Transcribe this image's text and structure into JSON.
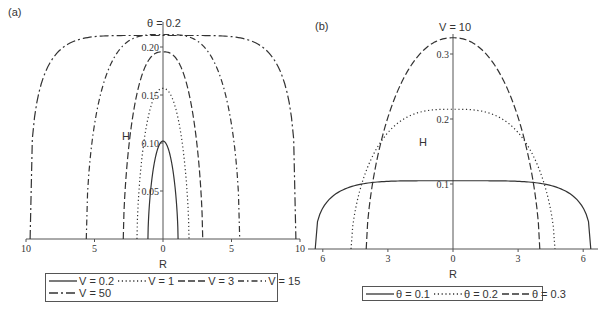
{
  "chart_data": [
    {
      "type": "line",
      "panel": "(a)",
      "title": "θ = 0.2",
      "xlabel": "R",
      "ylabel": "H",
      "x_ticks": [
        "10",
        "5",
        "0",
        "5",
        "10"
      ],
      "x_tick_values": [
        -10,
        -5,
        0,
        5,
        10
      ],
      "y_ticks": [
        "0.05",
        "0.10",
        "0.15",
        "0.20"
      ],
      "y_tick_values": [
        0.05,
        0.1,
        0.15,
        0.2
      ],
      "xlim": [
        -10,
        10
      ],
      "ylim": [
        0,
        0.225
      ],
      "grid": false,
      "legend_position": "bottom",
      "series": [
        {
          "name": "V = 0.2",
          "style": "solid",
          "half_width": 1.1,
          "peak": 0.102,
          "shape": 2.0
        },
        {
          "name": "V = 1",
          "style": "dotted",
          "half_width": 1.9,
          "peak": 0.157,
          "shape": 2.2
        },
        {
          "name": "V = 3",
          "style": "dashed",
          "half_width": 2.9,
          "peak": 0.195,
          "shape": 2.6
        },
        {
          "name": "V = 15",
          "style": "dashdot",
          "half_width": 5.6,
          "peak": 0.213,
          "shape": 3.5
        },
        {
          "name": "V = 50",
          "style": "longdash",
          "half_width": 9.7,
          "peak": 0.212,
          "shape": 6.0
        }
      ]
    },
    {
      "type": "line",
      "panel": "(b)",
      "title": "V = 10",
      "xlabel": "R",
      "ylabel": "H",
      "x_ticks": [
        "6",
        "3",
        "0",
        "3",
        "6"
      ],
      "x_tick_values": [
        -6,
        -3,
        0,
        3,
        6
      ],
      "y_ticks": [
        "0.1",
        "0.2",
        "0.3"
      ],
      "y_tick_values": [
        0.1,
        0.2,
        0.3
      ],
      "xlim": [
        -6.5,
        6.5
      ],
      "ylim": [
        0,
        0.33
      ],
      "grid": false,
      "legend_position": "bottom",
      "series": [
        {
          "name": "θ = 0.1",
          "style": "solid",
          "half_width": 6.35,
          "peak": 0.105,
          "shape": 5.0
        },
        {
          "name": "θ = 0.2",
          "style": "dotted",
          "half_width": 4.7,
          "peak": 0.215,
          "shape": 3.0
        },
        {
          "name": "θ = 0.3",
          "style": "dashed",
          "half_width": 4.0,
          "peak": 0.325,
          "shape": 2.2
        }
      ]
    }
  ],
  "panels": {
    "a": {
      "label": "(a)",
      "title": "θ = 0.2",
      "xlabel": "R",
      "ylabel": "H",
      "legend": [
        "V = 0.2",
        "V = 1",
        "V = 3",
        "V = 15",
        "V = 50"
      ]
    },
    "b": {
      "label": "(b)",
      "title": "V = 10",
      "xlabel": "R",
      "ylabel": "H",
      "legend": [
        "θ = 0.1",
        "θ = 0.2",
        "θ = 0.3"
      ]
    }
  },
  "layout": {
    "a": {
      "x0": 163,
      "xscale": 13.7,
      "y0": 239,
      "yscale": 960,
      "axis_left": 26,
      "axis_right": 300,
      "axis_top": 22
    },
    "b": {
      "x0": 453,
      "xscale": 21.7,
      "y0": 249,
      "yscale": 650,
      "axis_left": 308,
      "axis_right": 598,
      "axis_top": 34
    }
  },
  "colors": {
    "line": "#333333",
    "axis": "#555555",
    "text": "#333333"
  }
}
